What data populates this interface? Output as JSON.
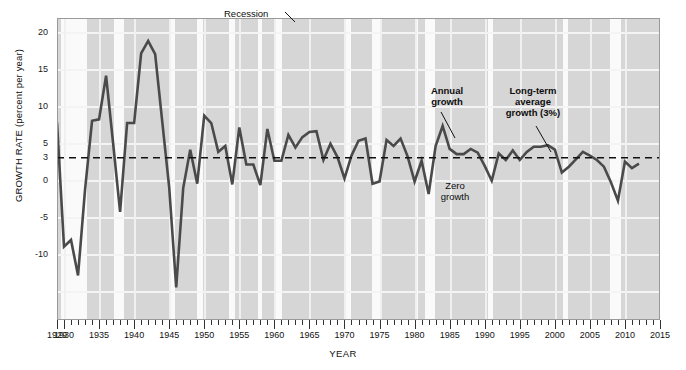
{
  "chart_data": {
    "type": "line",
    "title": "",
    "xlabel": "YEAR",
    "ylabel": "GROWTH RATE (percent per year)",
    "xlim": [
      1929,
      2015
    ],
    "ylim": [
      -15,
      22
    ],
    "grid": true,
    "legend_position": "none (inline annotations)",
    "y_ticks": [
      20,
      15,
      10,
      5,
      3,
      0,
      -5,
      -10
    ],
    "y_tick_labels": [
      "20",
      "15",
      "10",
      "5",
      "3",
      "0",
      "-5",
      "-10"
    ],
    "x_ticks": [
      1929,
      1930,
      1935,
      1940,
      1945,
      1950,
      1955,
      1960,
      1965,
      1970,
      1975,
      1980,
      1985,
      1990,
      1995,
      2000,
      2005,
      2010,
      2015
    ],
    "x_tick_labels": [
      "1929",
      "1930",
      "1935",
      "1940",
      "1945",
      "1950",
      "1955",
      "1960",
      "1965",
      "1970",
      "1975",
      "1980",
      "1985",
      "1990",
      "1995",
      "2000",
      "2005",
      "2010",
      "2015"
    ],
    "reference_line": {
      "label": "Long-term average growth (3%)",
      "value": 3,
      "style": "dashed"
    },
    "series": [
      {
        "name": "Annual growth",
        "color": "#4a4a4a",
        "x": [
          1929,
          1930,
          1931,
          1932,
          1933,
          1934,
          1935,
          1936,
          1937,
          1938,
          1939,
          1940,
          1941,
          1942,
          1943,
          1944,
          1945,
          1946,
          1947,
          1948,
          1949,
          1950,
          1951,
          1952,
          1953,
          1954,
          1955,
          1956,
          1957,
          1958,
          1959,
          1960,
          1961,
          1962,
          1963,
          1964,
          1965,
          1966,
          1967,
          1968,
          1969,
          1970,
          1971,
          1972,
          1973,
          1974,
          1975,
          1976,
          1977,
          1978,
          1979,
          1980,
          1981,
          1982,
          1983,
          1984,
          1985,
          1986,
          1987,
          1988,
          1989,
          1990,
          1991,
          1992,
          1993,
          1994,
          1995,
          1996,
          1997,
          1998,
          1999,
          2000,
          2001,
          2002,
          2003,
          2004,
          2005,
          2006,
          2007,
          2008,
          2009,
          2010,
          2011,
          2012
        ],
        "values": [
          7.8,
          -9.0,
          -8.1,
          -12.9,
          -1.3,
          8.0,
          8.2,
          14.1,
          5.0,
          -4.3,
          7.7,
          7.7,
          17.1,
          18.8,
          17.0,
          8.0,
          -1.0,
          -14.5,
          -1.1,
          4.1,
          -0.5,
          8.7,
          7.7,
          3.8,
          4.6,
          -0.6,
          7.1,
          2.1,
          2.1,
          -0.7,
          6.9,
          2.6,
          2.6,
          6.1,
          4.4,
          5.8,
          6.5,
          6.6,
          2.7,
          4.9,
          3.1,
          0.2,
          3.3,
          5.3,
          5.6,
          -0.5,
          -0.2,
          5.4,
          4.6,
          5.6,
          3.2,
          -0.2,
          2.6,
          -1.9,
          4.6,
          7.3,
          4.2,
          3.5,
          3.5,
          4.2,
          3.7,
          1.9,
          -0.1,
          3.6,
          2.7,
          4.0,
          2.7,
          3.8,
          4.5,
          4.5,
          4.7,
          4.1,
          1.0,
          1.8,
          2.8,
          3.8,
          3.3,
          2.7,
          1.8,
          -0.3,
          -2.8,
          2.5,
          1.6,
          2.2
        ]
      }
    ],
    "recession_bands": [
      {
        "start": 1929.6,
        "end": 1933.3
      },
      {
        "start": 1937.2,
        "end": 1938.5
      },
      {
        "start": 1945.1,
        "end": 1945.8
      },
      {
        "start": 1948.9,
        "end": 1949.8
      },
      {
        "start": 1953.5,
        "end": 1954.4
      },
      {
        "start": 1957.6,
        "end": 1958.3
      },
      {
        "start": 1960.3,
        "end": 1961.1
      },
      {
        "start": 1969.9,
        "end": 1970.9
      },
      {
        "start": 1973.9,
        "end": 1975.2
      },
      {
        "start": 1980.0,
        "end": 1980.5
      },
      {
        "start": 1981.5,
        "end": 1982.9
      },
      {
        "start": 1990.5,
        "end": 1991.2
      },
      {
        "start": 2001.2,
        "end": 2001.9
      },
      {
        "start": 2007.9,
        "end": 2009.5
      }
    ],
    "annotations": [
      {
        "name": "recession",
        "text": "Recession"
      },
      {
        "name": "annual-growth",
        "text_line1": "Annual",
        "text_line2": "growth"
      },
      {
        "name": "long-term-average",
        "text_line1": "Long-term",
        "text_line2": "average",
        "text_line3": "growth (3%)"
      },
      {
        "name": "zero-growth",
        "text_line1": "Zero",
        "text_line2": "growth"
      }
    ]
  },
  "axes": {
    "y_title": "GROWTH RATE (percent per year)",
    "x_title": "YEAR"
  },
  "annotations": {
    "recession": "Recession",
    "annual_growth_l1": "Annual",
    "annual_growth_l2": "growth",
    "long_term_l1": "Long-term",
    "long_term_l2": "average",
    "long_term_l3": "growth (3%)",
    "zero_growth_l1": "Zero",
    "zero_growth_l2": "growth"
  },
  "colors": {
    "plot_background": "#d6d6d6",
    "recession_band": "#fafafa",
    "line": "#4a4a4a",
    "gridline": "#f4f4f4",
    "text": "#111111"
  }
}
